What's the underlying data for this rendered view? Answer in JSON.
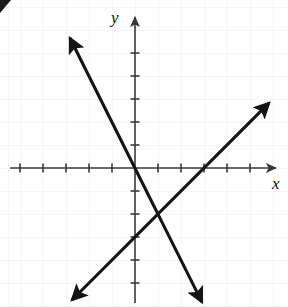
{
  "figure": {
    "kind": "cartesian-coordinate-plane",
    "width": 288,
    "height": 307,
    "background_color": "#ffffff",
    "ink_color": "#141414",
    "axis_color": "#3a3a3a",
    "grid_color": "#f0f0f0",
    "corner_mark_label": "A"
  },
  "axes": {
    "x_label": "x",
    "y_label": "y",
    "origin_px": {
      "x": 135,
      "y": 168
    },
    "unit_px": 23,
    "x_axis": {
      "y_px": 168,
      "start_px": 10,
      "end_px": 280,
      "arrow": "right",
      "tick_values": [
        -5,
        -4,
        -3,
        -2,
        -1,
        1,
        2,
        3,
        4,
        5,
        6
      ],
      "tick_length_px": 9,
      "tick_labels_shown": false
    },
    "y_axis": {
      "x_px": 135,
      "start_px": 14,
      "end_px": 303,
      "arrow": "up",
      "tick_values": [
        -5,
        -4,
        -3,
        -2,
        -1,
        1,
        2,
        3,
        4,
        5
      ],
      "tick_length_px": 9,
      "tick_labels_shown": false
    }
  },
  "chart_data": {
    "type": "line",
    "title": "",
    "xlabel": "x",
    "ylabel": "y",
    "xlim": [
      -5.4,
      6.3
    ],
    "ylim": [
      -6.0,
      6.7
    ],
    "grid": true,
    "legend": "none",
    "annotations": [],
    "series": [
      {
        "name": "descending-line",
        "slope": -2,
        "y_intercept": 0,
        "equation": "y = -2x",
        "x_intercept": 0,
        "arrows": "both",
        "endpoints": [
          {
            "x": -2.83,
            "y": 5.65
          },
          {
            "x": 2.91,
            "y": -5.83
          }
        ],
        "endpoints_px": [
          {
            "x": 70,
            "y": 38
          },
          {
            "x": 202,
            "y": 302
          }
        ]
      },
      {
        "name": "ascending-line",
        "slope": 1,
        "y_intercept": -3,
        "equation": "y = x - 3",
        "x_intercept": 3,
        "arrows": "both",
        "endpoints": [
          {
            "x": -2.74,
            "y": -5.74
          },
          {
            "x": 5.83,
            "y": 2.83
          }
        ],
        "endpoints_px": [
          {
            "x": 72,
            "y": 300
          },
          {
            "x": 269,
            "y": 103
          }
        ]
      }
    ],
    "intersection": {
      "x": 1,
      "y": -2
    }
  }
}
